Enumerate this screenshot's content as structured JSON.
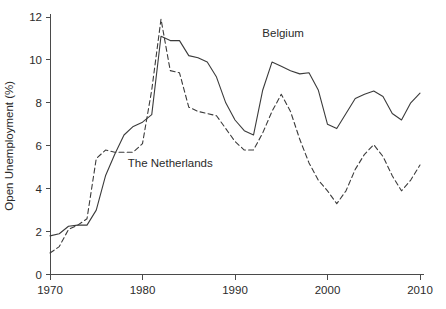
{
  "chart_data": {
    "type": "line",
    "title": "",
    "xlabel": "",
    "ylabel": "Open Unemployment (%)",
    "xlim": [
      1970,
      2010
    ],
    "ylim": [
      0,
      12
    ],
    "grid": false,
    "legend_position": "inline-annotations",
    "x_ticks": [
      "1970",
      "1980",
      "1990",
      "2000",
      "2010"
    ],
    "x_tick_values": [
      1970,
      1980,
      1990,
      2000,
      2010
    ],
    "y_ticks": [
      "0",
      "2",
      "4",
      "6",
      "8",
      "10",
      "12"
    ],
    "y_tick_values": [
      0,
      2,
      4,
      6,
      8,
      10,
      12
    ],
    "x": [
      1970,
      1971,
      1972,
      1973,
      1974,
      1975,
      1976,
      1977,
      1978,
      1979,
      1980,
      1981,
      1982,
      1983,
      1984,
      1985,
      1986,
      1987,
      1988,
      1989,
      1990,
      1991,
      1992,
      1993,
      1994,
      1995,
      1996,
      1997,
      1998,
      1999,
      2000,
      2001,
      2002,
      2003,
      2004,
      2005,
      2006,
      2007,
      2008,
      2009,
      2010
    ],
    "series": [
      {
        "name": "Belgium",
        "style": "solid",
        "color": "#3b3b3b",
        "label_x": 1995.2,
        "label_y": 11.05,
        "values": [
          1.8,
          1.9,
          2.25,
          2.3,
          2.3,
          3.0,
          4.6,
          5.6,
          6.5,
          6.9,
          7.1,
          7.45,
          11.1,
          10.9,
          10.9,
          10.2,
          10.1,
          9.9,
          9.2,
          8.0,
          7.2,
          6.7,
          6.5,
          8.6,
          9.9,
          9.7,
          9.5,
          9.35,
          9.4,
          8.6,
          7.0,
          6.8,
          7.5,
          8.2,
          8.4,
          8.55,
          8.3,
          7.5,
          7.2,
          8.0,
          8.45
        ]
      },
      {
        "name": "The Netherlands",
        "style": "dashed",
        "color": "#3b3b3b",
        "label_x": 1983.0,
        "label_y": 5.0,
        "values": [
          1.0,
          1.3,
          2.1,
          2.3,
          2.6,
          5.4,
          5.8,
          5.7,
          5.7,
          5.7,
          6.1,
          8.6,
          11.9,
          9.5,
          9.4,
          7.8,
          7.6,
          7.5,
          7.4,
          6.8,
          6.2,
          5.8,
          5.8,
          6.6,
          7.6,
          8.4,
          7.6,
          6.3,
          5.2,
          4.4,
          3.9,
          3.3,
          3.9,
          4.9,
          5.6,
          6.05,
          5.5,
          4.6,
          3.9,
          4.4,
          5.1
        ]
      }
    ]
  },
  "annotations": {
    "belgium_label": "Belgium",
    "netherlands_label": "The Netherlands"
  }
}
